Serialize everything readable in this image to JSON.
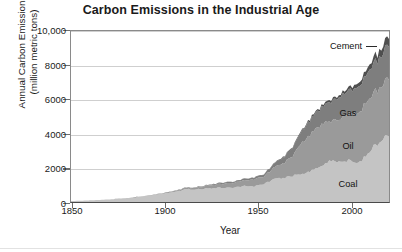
{
  "chart_data": {
    "type": "area",
    "title": "Carbon Emissions in the Industrial Age",
    "xlabel": "Year",
    "ylabel": "Annual Carbon Emissions\n(million metric tons)",
    "ylabel_line1": "Annual Carbon Emissions",
    "ylabel_line2": "(million metric tons)",
    "stacked": true,
    "grid": true,
    "legend_position": "inline-annotations",
    "xlim": [
      1850,
      2015
    ],
    "ylim": [
      0,
      10000
    ],
    "xticks": [
      1850,
      1900,
      1950,
      2000
    ],
    "xtick_labels": [
      "1850",
      "1900",
      "1950",
      "2000"
    ],
    "yticks": [
      0,
      2000,
      4000,
      6000,
      8000,
      10000
    ],
    "ytick_labels": [
      "0",
      "2000",
      "4000",
      "6000",
      "8000",
      "10,000"
    ],
    "x": [
      1850,
      1855,
      1860,
      1865,
      1870,
      1875,
      1880,
      1885,
      1890,
      1895,
      1900,
      1905,
      1910,
      1915,
      1920,
      1925,
      1930,
      1935,
      1940,
      1945,
      1950,
      1955,
      1960,
      1965,
      1970,
      1975,
      1980,
      1985,
      1990,
      1995,
      2000,
      2005,
      2010,
      2014
    ],
    "series": [
      {
        "name": "Coal",
        "color": "#c4c4c4",
        "values": [
          54,
          73,
          94,
          122,
          151,
          190,
          236,
          281,
          357,
          425,
          514,
          620,
          742,
          740,
          791,
          820,
          844,
          845,
          960,
          899,
          1070,
          1310,
          1410,
          1530,
          1680,
          1840,
          2150,
          2400,
          2390,
          2410,
          2340,
          2990,
          3540,
          3870
        ]
      },
      {
        "name": "Oil",
        "color": "#9a9a9a",
        "values": [
          0,
          0,
          1,
          2,
          4,
          6,
          10,
          14,
          20,
          29,
          39,
          56,
          83,
          107,
          148,
          195,
          249,
          289,
          333,
          413,
          423,
          670,
          849,
          1150,
          1840,
          2240,
          2410,
          2300,
          2550,
          2740,
          2930,
          3110,
          3200,
          3290
        ]
      },
      {
        "name": "Gas",
        "color": "#7e7e7e",
        "values": [
          0,
          0,
          0,
          0,
          0,
          1,
          2,
          3,
          5,
          7,
          9,
          12,
          18,
          23,
          35,
          48,
          62,
          69,
          85,
          104,
          122,
          204,
          337,
          482,
          716,
          860,
          1000,
          1150,
          1290,
          1400,
          1550,
          1660,
          1790,
          1900
        ]
      },
      {
        "name": "Cement",
        "color": "#4f4f4f",
        "values": [
          0,
          0,
          0,
          0,
          0,
          0,
          0,
          1,
          1,
          2,
          3,
          4,
          6,
          5,
          8,
          12,
          15,
          14,
          17,
          15,
          18,
          28,
          38,
          50,
          70,
          86,
          105,
          120,
          140,
          180,
          220,
          310,
          400,
          470
        ]
      }
    ],
    "annotations": [
      {
        "label": "Cement",
        "x_px": 346,
        "y_px": 46,
        "leader": true
      },
      {
        "label": "Gas",
        "x_px": 348,
        "y_px": 113,
        "leader": false
      },
      {
        "label": "Oil",
        "x_px": 348,
        "y_px": 146,
        "leader": false
      },
      {
        "label": "Coal",
        "x_px": 348,
        "y_px": 184,
        "leader": false
      }
    ]
  }
}
